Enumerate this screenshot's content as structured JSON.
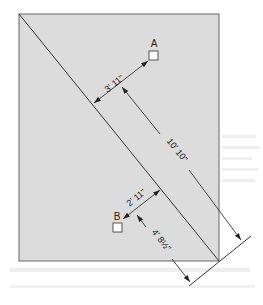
{
  "diagram": {
    "colors": {
      "panel_fill": "#dcdcdc",
      "panel_stroke": "#555555",
      "line": "#333333",
      "box_fill": "#ffffff"
    },
    "points": {
      "A": {
        "label": "A"
      },
      "B": {
        "label": "B"
      }
    },
    "dimensions": {
      "a_to_diagonal": "3' 11\"",
      "diagonal_length_offset": "10' 10\"",
      "b_to_diagonal": "2' 11\"",
      "b_along_diagonal": "4' 8½\""
    }
  }
}
